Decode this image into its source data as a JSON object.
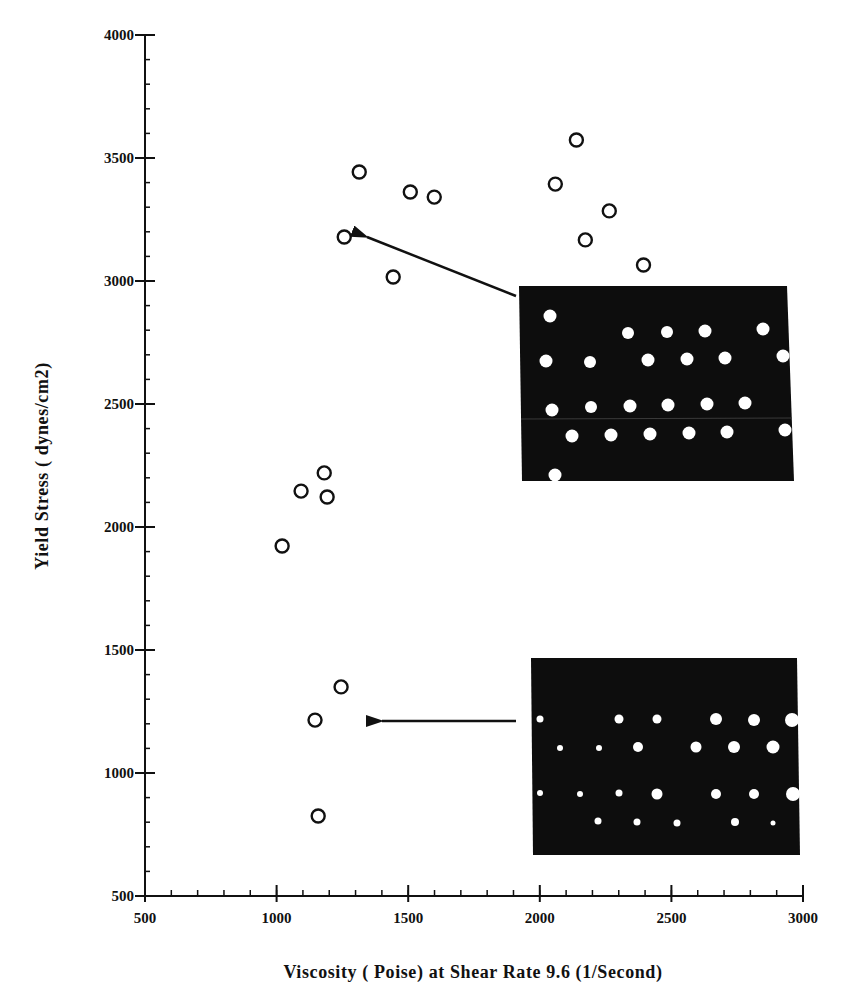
{
  "chart_data": {
    "type": "scatter",
    "title": "",
    "xlabel": "Viscosity   ( Poise) at Shear Rate 9.6 (1/Second)",
    "ylabel": "Yield Stress  ( dynes/cm2)",
    "xlim": [
      500,
      3000
    ],
    "ylim": [
      500,
      4000
    ],
    "x_ticks": [
      500,
      1000,
      1500,
      2000,
      2500,
      3000
    ],
    "y_ticks": [
      500,
      1000,
      1500,
      2000,
      2500,
      3000,
      3500,
      4000
    ],
    "x_minor_step": 100,
    "y_minor_step": 100,
    "grid": false,
    "legend": null,
    "marker": "open-circle",
    "series": [
      {
        "name": "samples",
        "points": [
          {
            "x": 1314,
            "y": 3443
          },
          {
            "x": 1508,
            "y": 3362
          },
          {
            "x": 1599,
            "y": 3341
          },
          {
            "x": 1257,
            "y": 3179
          },
          {
            "x": 1443,
            "y": 3016
          },
          {
            "x": 2139,
            "y": 3573
          },
          {
            "x": 2059,
            "y": 3394
          },
          {
            "x": 2264,
            "y": 3285
          },
          {
            "x": 2173,
            "y": 3167
          },
          {
            "x": 2394,
            "y": 3065
          },
          {
            "x": 1181,
            "y": 2220
          },
          {
            "x": 1093,
            "y": 2146
          },
          {
            "x": 1192,
            "y": 2122
          },
          {
            "x": 1021,
            "y": 1923
          },
          {
            "x": 1245,
            "y": 1350
          },
          {
            "x": 1146,
            "y": 1215
          },
          {
            "x": 1158,
            "y": 825
          }
        ]
      }
    ],
    "annotations": [
      {
        "type": "inset-image-with-arrow",
        "description": "micrograph: dark background with larger, uniform white dots",
        "arrow_target": {
          "x": 1270,
          "y": 3180
        }
      },
      {
        "type": "inset-image-with-arrow",
        "description": "micrograph: dark background with smaller, non-uniform white dots",
        "arrow_target": {
          "x": 1310,
          "y": 1200
        }
      }
    ]
  }
}
